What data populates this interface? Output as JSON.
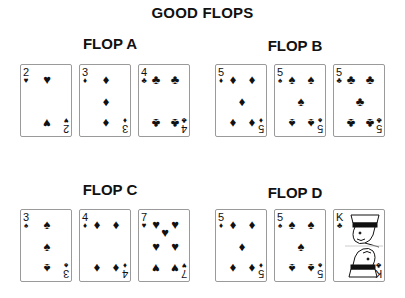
{
  "title": "GOOD FLOPS",
  "flops": [
    {
      "label": "FLOP A",
      "cards": [
        {
          "rank": "2",
          "suit": "♥",
          "suit_name": "hearts"
        },
        {
          "rank": "3",
          "suit": "♦",
          "suit_name": "diamonds"
        },
        {
          "rank": "4",
          "suit": "♣",
          "suit_name": "clubs"
        }
      ]
    },
    {
      "label": "FLOP B",
      "cards": [
        {
          "rank": "5",
          "suit": "♦",
          "suit_name": "diamonds"
        },
        {
          "rank": "5",
          "suit": "♠",
          "suit_name": "spades"
        },
        {
          "rank": "5",
          "suit": "♣",
          "suit_name": "clubs"
        }
      ]
    },
    {
      "label": "FLOP C",
      "cards": [
        {
          "rank": "3",
          "suit": "♠",
          "suit_name": "spades"
        },
        {
          "rank": "4",
          "suit": "♦",
          "suit_name": "diamonds"
        },
        {
          "rank": "7",
          "suit": "♥",
          "suit_name": "hearts"
        }
      ]
    },
    {
      "label": "FLOP D",
      "cards": [
        {
          "rank": "5",
          "suit": "♦",
          "suit_name": "diamonds"
        },
        {
          "rank": "5",
          "suit": "♠",
          "suit_name": "spades"
        },
        {
          "rank": "K",
          "suit": "♣",
          "suit_name": "clubs"
        }
      ]
    }
  ]
}
